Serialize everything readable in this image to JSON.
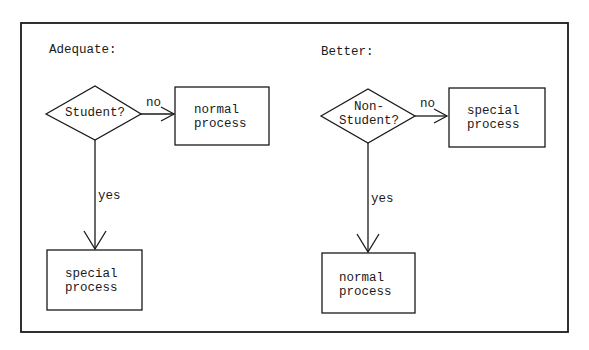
{
  "colors": {
    "stroke": "#1a1a1a",
    "background": "#ffffff"
  },
  "panels": [
    {
      "heading": "Adequate:",
      "decision": {
        "line1": "Student?",
        "line2": ""
      },
      "no_label": "no",
      "yes_label": "yes",
      "no_box": {
        "line1": "normal",
        "line2": "process"
      },
      "yes_box": {
        "line1": "special",
        "line2": "process"
      }
    },
    {
      "heading": "Better:",
      "decision": {
        "line1": "Non-",
        "line2": "Student?"
      },
      "no_label": "no",
      "yes_label": "yes",
      "no_box": {
        "line1": "special",
        "line2": "process"
      },
      "yes_box": {
        "line1": "normal",
        "line2": "process"
      }
    }
  ]
}
